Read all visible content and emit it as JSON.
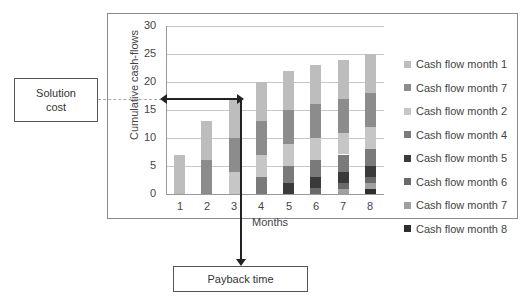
{
  "chart_data": {
    "type": "bar",
    "stacked": true,
    "title": "",
    "xlabel": "Months",
    "ylabel": "Cumulative cash-flows",
    "ylim": [
      0,
      30
    ],
    "yticks": [
      0,
      5,
      10,
      15,
      20,
      25,
      30
    ],
    "categories": [
      "1",
      "2",
      "3",
      "4",
      "5",
      "6",
      "7",
      "8"
    ],
    "grid": true,
    "legend_position": "right",
    "series": [
      {
        "name": "Cash flow month 1",
        "color": "#bdbdbd",
        "values": [
          7,
          7,
          7,
          7,
          7,
          7,
          7,
          7
        ]
      },
      {
        "name": "Cash flow month 7",
        "color": "#8c8c8c",
        "values": [
          0,
          6,
          6,
          6,
          6,
          6,
          6,
          6
        ]
      },
      {
        "name": "Cash flow month 2",
        "color": "#c6c6c6",
        "values": [
          0,
          0,
          4,
          4,
          4,
          4,
          4,
          4
        ]
      },
      {
        "name": "Cash flow month 4",
        "color": "#7a7a7a",
        "values": [
          0,
          0,
          0,
          3,
          3,
          3,
          3,
          3
        ]
      },
      {
        "name": "Cash flow month 5",
        "color": "#3a3a3a",
        "values": [
          0,
          0,
          0,
          0,
          2,
          2,
          2,
          2
        ]
      },
      {
        "name": "Cash flow month 6",
        "color": "#6a6a6a",
        "values": [
          0,
          0,
          0,
          0,
          0,
          1,
          1,
          1
        ]
      },
      {
        "name": "Cash flow month 7",
        "color": "#a0a0a0",
        "values": [
          0,
          0,
          0,
          0,
          0,
          0,
          1,
          1
        ]
      },
      {
        "name": "Cash flow month 8",
        "color": "#2e2e2e",
        "values": [
          0,
          0,
          0,
          0,
          0,
          0,
          0,
          1
        ]
      }
    ],
    "totals": [
      7,
      13,
      17,
      20,
      22,
      23,
      24,
      25
    ],
    "annotations": [
      {
        "text": "Solution cost",
        "value": 17
      },
      {
        "text": "Payback time",
        "at_month": 3
      }
    ]
  },
  "labels": {
    "solution_cost": "Solution cost",
    "payback_time": "Payback time",
    "y_axis_title": "Cumulative cash-flows",
    "x_axis_title": "Months"
  }
}
